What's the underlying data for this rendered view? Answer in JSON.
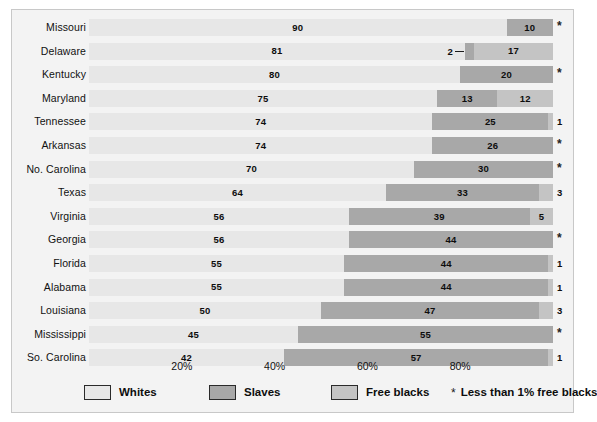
{
  "chart_data": {
    "type": "bar",
    "subtype": "stacked-horizontal-100pct",
    "title": "",
    "xlabel": "",
    "ylabel": "",
    "xlim": [
      0,
      100
    ],
    "grid": false,
    "legend_position": "bottom",
    "axis_ticks": [
      "20%",
      "40%",
      "60%",
      "80%"
    ],
    "axis_tick_values": [
      20,
      40,
      60,
      80
    ],
    "categories": [
      "Missouri",
      "Delaware",
      "Kentucky",
      "Maryland",
      "Tennessee",
      "Arkansas",
      "No. Carolina",
      "Texas",
      "Virginia",
      "Georgia",
      "Florida",
      "Alabama",
      "Louisiana",
      "Mississippi",
      "So. Carolina"
    ],
    "series": [
      {
        "name": "Whites",
        "color": "#e7e7e7",
        "values": [
          90,
          81,
          80,
          75,
          74,
          74,
          70,
          64,
          56,
          56,
          55,
          55,
          50,
          45,
          42
        ]
      },
      {
        "name": "Slaves",
        "color": "#a8a8a8",
        "values": [
          10,
          2,
          20,
          13,
          25,
          26,
          30,
          33,
          39,
          44,
          44,
          44,
          47,
          55,
          57
        ]
      },
      {
        "name": "Free blacks",
        "color": "#c4c4c4",
        "values": [
          0,
          17,
          0,
          12,
          1,
          0,
          0,
          3,
          5,
          0,
          1,
          1,
          3,
          0,
          1
        ]
      }
    ],
    "free_black_labels": [
      "*",
      "17",
      "*",
      "12",
      "1",
      "*",
      "*",
      "3",
      "5",
      "*",
      "1",
      "1",
      "3",
      "*",
      "1"
    ],
    "footnote_symbol": "*",
    "footnote_text": "Less than 1% free blacks"
  },
  "legend": {
    "items": [
      {
        "label": "Whites",
        "color": "#e7e7e7"
      },
      {
        "label": "Slaves",
        "color": "#a8a8a8"
      },
      {
        "label": "Free blacks",
        "color": "#c4c4c4"
      }
    ],
    "note_symbol": "*",
    "note_label": "Less than 1% free blacks"
  },
  "rows": [
    {
      "state": "Missouri",
      "whites": 90,
      "slaves": 10,
      "free": 0,
      "whites_label": "90",
      "slaves_label": "10",
      "free_label": "*",
      "free_outside": true,
      "callout": false
    },
    {
      "state": "Delaware",
      "whites": 81,
      "slaves": 2,
      "free": 17,
      "whites_label": "81",
      "slaves_label": "2",
      "free_label": "17",
      "free_outside": false,
      "callout": true
    },
    {
      "state": "Kentucky",
      "whites": 80,
      "slaves": 20,
      "free": 0,
      "whites_label": "80",
      "slaves_label": "20",
      "free_label": "*",
      "free_outside": true,
      "callout": false
    },
    {
      "state": "Maryland",
      "whites": 75,
      "slaves": 13,
      "free": 12,
      "whites_label": "75",
      "slaves_label": "13",
      "free_label": "12",
      "free_outside": false,
      "callout": false
    },
    {
      "state": "Tennessee",
      "whites": 74,
      "slaves": 25,
      "free": 1,
      "whites_label": "74",
      "slaves_label": "25",
      "free_label": "1",
      "free_outside": true,
      "callout": false
    },
    {
      "state": "Arkansas",
      "whites": 74,
      "slaves": 26,
      "free": 0,
      "whites_label": "74",
      "slaves_label": "26",
      "free_label": "*",
      "free_outside": true,
      "callout": false
    },
    {
      "state": "No. Carolina",
      "whites": 70,
      "slaves": 30,
      "free": 0,
      "whites_label": "70",
      "slaves_label": "30",
      "free_label": "*",
      "free_outside": true,
      "callout": false
    },
    {
      "state": "Texas",
      "whites": 64,
      "slaves": 33,
      "free": 3,
      "whites_label": "64",
      "slaves_label": "33",
      "free_label": "3",
      "free_outside": true,
      "callout": false
    },
    {
      "state": "Virginia",
      "whites": 56,
      "slaves": 39,
      "free": 5,
      "whites_label": "56",
      "slaves_label": "39",
      "free_label": "5",
      "free_outside": false,
      "callout": false
    },
    {
      "state": "Georgia",
      "whites": 56,
      "slaves": 44,
      "free": 0,
      "whites_label": "56",
      "slaves_label": "44",
      "free_label": "*",
      "free_outside": true,
      "callout": false
    },
    {
      "state": "Florida",
      "whites": 55,
      "slaves": 44,
      "free": 1,
      "whites_label": "55",
      "slaves_label": "44",
      "free_label": "1",
      "free_outside": true,
      "callout": false
    },
    {
      "state": "Alabama",
      "whites": 55,
      "slaves": 44,
      "free": 1,
      "whites_label": "55",
      "slaves_label": "44",
      "free_label": "1",
      "free_outside": true,
      "callout": false
    },
    {
      "state": "Louisiana",
      "whites": 50,
      "slaves": 47,
      "free": 3,
      "whites_label": "50",
      "slaves_label": "47",
      "free_label": "3",
      "free_outside": true,
      "callout": false
    },
    {
      "state": "Mississippi",
      "whites": 45,
      "slaves": 55,
      "free": 0,
      "whites_label": "45",
      "slaves_label": "55",
      "free_label": "*",
      "free_outside": true,
      "callout": false
    },
    {
      "state": "So. Carolina",
      "whites": 42,
      "slaves": 57,
      "free": 1,
      "whites_label": "42",
      "slaves_label": "57",
      "free_label": "1",
      "free_outside": true,
      "callout": false
    }
  ],
  "axis": {
    "ticks": [
      {
        "label": "20%",
        "value": 20
      },
      {
        "label": "40%",
        "value": 40
      },
      {
        "label": "60%",
        "value": 60
      },
      {
        "label": "80%",
        "value": 80
      }
    ]
  }
}
